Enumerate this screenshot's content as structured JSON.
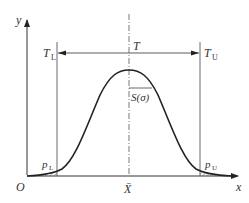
{
  "diagram": {
    "type": "normal distribution with tolerance limits",
    "axes": {
      "y_label": "y",
      "x_label": "x",
      "origin_label": "O"
    },
    "limits": {
      "lower": {
        "label": "T",
        "subscript": "L"
      },
      "upper": {
        "label": "T",
        "subscript": "U"
      },
      "tolerance_label": "T"
    },
    "mean_label": "X̄",
    "sigma_label": "S(σ)",
    "tail_areas": {
      "lower": {
        "label": "p",
        "subscript": "L"
      },
      "upper": {
        "label": "p",
        "subscript": "U"
      }
    },
    "colors": {
      "line": "#333333",
      "curve": "#222222",
      "hatch": "#666666"
    }
  }
}
